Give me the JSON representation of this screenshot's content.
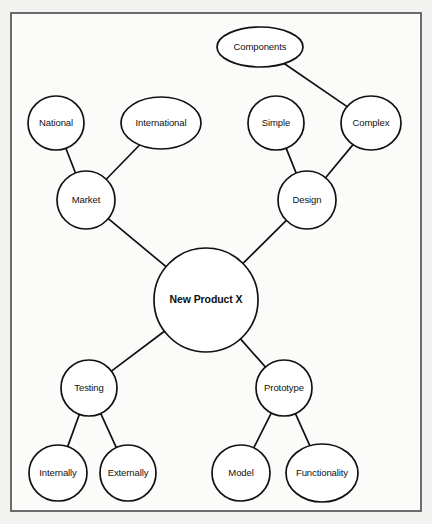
{
  "diagram": {
    "type": "mind-map",
    "background_color": "#f2f2f0",
    "canvas_color": "#fbfbfa",
    "border_color": "#4a4a4a",
    "node_fill": "#ffffff",
    "node_stroke": "#111111",
    "frame": {
      "x": 11,
      "y": 13,
      "width": 410,
      "height": 498
    },
    "root": "New Product X",
    "nodes": [
      {
        "id": "components",
        "label": "Components",
        "cx": 260,
        "cy": 47,
        "rx": 43,
        "ry": 20,
        "shape": "ellipse",
        "bold": false
      },
      {
        "id": "national",
        "label": "National",
        "cx": 56,
        "cy": 123,
        "rx": 28,
        "ry": 27,
        "shape": "ellipse",
        "bold": false
      },
      {
        "id": "international",
        "label": "International",
        "cx": 161,
        "cy": 123,
        "rx": 40,
        "ry": 26,
        "shape": "ellipse",
        "bold": false
      },
      {
        "id": "simple",
        "label": "Simple",
        "cx": 276,
        "cy": 123,
        "rx": 28,
        "ry": 27,
        "shape": "ellipse",
        "bold": false
      },
      {
        "id": "complex",
        "label": "Complex",
        "cx": 371,
        "cy": 123,
        "rx": 30,
        "ry": 27,
        "shape": "ellipse",
        "bold": false
      },
      {
        "id": "market",
        "label": "Market",
        "cx": 86,
        "cy": 200,
        "rx": 29,
        "ry": 29,
        "shape": "ellipse",
        "bold": false
      },
      {
        "id": "design",
        "label": "Design",
        "cx": 307,
        "cy": 200,
        "rx": 29,
        "ry": 29,
        "shape": "ellipse",
        "bold": false
      },
      {
        "id": "new-product-x",
        "label": "New Product X",
        "cx": 206,
        "cy": 300,
        "rx": 52,
        "ry": 52,
        "shape": "ellipse",
        "bold": true
      },
      {
        "id": "testing",
        "label": "Testing",
        "cx": 89,
        "cy": 388,
        "rx": 28,
        "ry": 28,
        "shape": "ellipse",
        "bold": false
      },
      {
        "id": "prototype",
        "label": "Prototype",
        "cx": 284,
        "cy": 388,
        "rx": 28,
        "ry": 28,
        "shape": "ellipse",
        "bold": false
      },
      {
        "id": "internally",
        "label": "Internally",
        "cx": 58,
        "cy": 473,
        "rx": 29,
        "ry": 28,
        "shape": "ellipse",
        "bold": false
      },
      {
        "id": "externally",
        "label": "Externally",
        "cx": 128,
        "cy": 473,
        "rx": 28,
        "ry": 28,
        "shape": "ellipse",
        "bold": false
      },
      {
        "id": "model",
        "label": "Model",
        "cx": 241,
        "cy": 473,
        "rx": 29,
        "ry": 28,
        "shape": "ellipse",
        "bold": false
      },
      {
        "id": "functionality",
        "label": "Functionality",
        "cx": 322,
        "cy": 473,
        "rx": 36,
        "ry": 29,
        "shape": "ellipse",
        "bold": false
      }
    ],
    "edges": [
      {
        "id": "edge-components-complex",
        "from": "components",
        "to": "complex"
      },
      {
        "id": "edge-simple-design",
        "from": "simple",
        "to": "design"
      },
      {
        "id": "edge-complex-design",
        "from": "complex",
        "to": "design"
      },
      {
        "id": "edge-national-market",
        "from": "national",
        "to": "market"
      },
      {
        "id": "edge-international-market",
        "from": "international",
        "to": "market"
      },
      {
        "id": "edge-market-new-product-x",
        "from": "market",
        "to": "new-product-x"
      },
      {
        "id": "edge-design-new-product-x",
        "from": "design",
        "to": "new-product-x"
      },
      {
        "id": "edge-new-product-x-testing",
        "from": "new-product-x",
        "to": "testing"
      },
      {
        "id": "edge-new-product-x-prototype",
        "from": "new-product-x",
        "to": "prototype"
      },
      {
        "id": "edge-testing-internally",
        "from": "testing",
        "to": "internally"
      },
      {
        "id": "edge-testing-externally",
        "from": "testing",
        "to": "externally"
      },
      {
        "id": "edge-prototype-model",
        "from": "prototype",
        "to": "model"
      },
      {
        "id": "edge-prototype-functionality",
        "from": "prototype",
        "to": "functionality"
      }
    ]
  }
}
